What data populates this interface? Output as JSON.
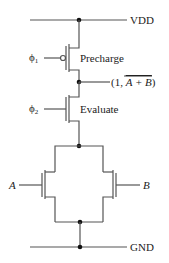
{
  "diagram": {
    "type": "dynamic CMOS NOR gate",
    "rails": {
      "supply": "VDD",
      "ground": "GND"
    },
    "transistors": [
      {
        "name": "precharge",
        "kind": "PMOS",
        "label": "Precharge",
        "gate": "ϕ",
        "gate_sub": "1"
      },
      {
        "name": "evaluate",
        "kind": "NMOS",
        "label": "Evaluate",
        "gate": "ϕ",
        "gate_sub": "2"
      },
      {
        "name": "input-a",
        "kind": "NMOS",
        "gate": "A"
      },
      {
        "name": "input-b",
        "kind": "NMOS",
        "gate": "B"
      }
    ],
    "output": {
      "prefix": "(1, ",
      "expr": "A + B",
      "suffix": ")",
      "overline": true
    }
  }
}
